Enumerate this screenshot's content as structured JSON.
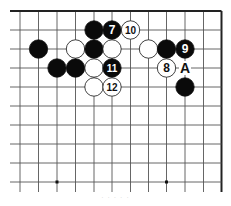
{
  "diagram": {
    "type": "go-board-fragment",
    "colors": {
      "line": "#555555",
      "edge": "#222222",
      "black_stone": "#0a0a0a",
      "white_stone": "#ffffff",
      "stone_outline": "#111111"
    },
    "grid": {
      "x_lines": [
        20,
        38.5,
        57,
        75.5,
        94,
        112,
        130.5,
        148.5,
        166.5,
        185,
        203.5,
        221.5
      ],
      "y_lines": [
        11,
        30,
        49,
        68,
        87,
        106,
        125,
        144,
        163,
        182
      ],
      "x_extent": [
        10,
        221.5
      ],
      "y_extent": [
        11,
        192
      ],
      "top_edge": true,
      "right_edge": true
    },
    "hoshi": [
      {
        "col": 2,
        "row": 9
      },
      {
        "col": 8,
        "row": 9
      }
    ],
    "stones": [
      {
        "color": "black",
        "col": 4,
        "row": 1,
        "label": ""
      },
      {
        "color": "black",
        "col": 5,
        "row": 1,
        "label": "7"
      },
      {
        "color": "white",
        "col": 6,
        "row": 1,
        "label": "10"
      },
      {
        "color": "black",
        "col": 1,
        "row": 2,
        "label": ""
      },
      {
        "color": "white",
        "col": 3,
        "row": 2,
        "label": ""
      },
      {
        "color": "black",
        "col": 4,
        "row": 2,
        "label": ""
      },
      {
        "color": "white",
        "col": 5,
        "row": 2,
        "label": ""
      },
      {
        "color": "white",
        "col": 7,
        "row": 2,
        "label": ""
      },
      {
        "color": "black",
        "col": 8,
        "row": 2,
        "label": ""
      },
      {
        "color": "black",
        "col": 9,
        "row": 2,
        "label": "9"
      },
      {
        "color": "black",
        "col": 2,
        "row": 3,
        "label": ""
      },
      {
        "color": "black",
        "col": 3,
        "row": 3,
        "label": ""
      },
      {
        "color": "white",
        "col": 4,
        "row": 3,
        "label": ""
      },
      {
        "color": "black",
        "col": 5,
        "row": 3,
        "label": "11"
      },
      {
        "color": "white",
        "col": 8,
        "row": 3,
        "label": "8"
      },
      {
        "color": "white",
        "col": 4,
        "row": 4,
        "label": ""
      },
      {
        "color": "white",
        "col": 5,
        "row": 4,
        "label": "12"
      },
      {
        "color": "black",
        "col": 9,
        "row": 4,
        "label": ""
      }
    ],
    "markers": [
      {
        "col": 9,
        "row": 3,
        "label": "A"
      }
    ],
    "caption": "· · · · ·"
  }
}
